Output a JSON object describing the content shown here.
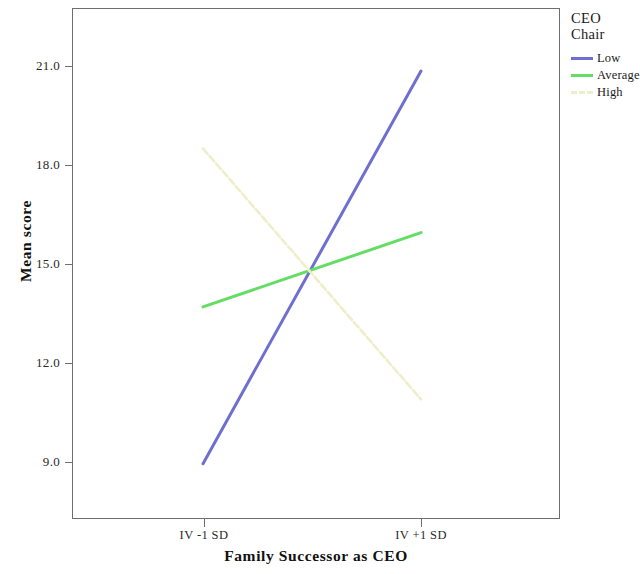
{
  "chart_data": {
    "type": "line",
    "title": "",
    "xlabel": "Family Successor as CEO",
    "ylabel": "Mean score",
    "categories": [
      "IV -1 SD",
      "IV +1 SD"
    ],
    "x": [
      0,
      1
    ],
    "ytick_labels": [
      "9.0",
      "12.0",
      "15.0",
      "18.0",
      "21.0"
    ],
    "ytick_values": [
      9.0,
      12.0,
      15.0,
      18.0,
      21.0
    ],
    "ylim": [
      7.6,
      22.5
    ],
    "xlim": [
      -0.5,
      1.5
    ],
    "grid": false,
    "legend_position": "right",
    "legend_title_line1": "CEO",
    "legend_title_line2": "Chair",
    "series": [
      {
        "name": "Low",
        "values": [
          8.95,
          20.85
        ],
        "color": "#6f6fd0",
        "style": "solid"
      },
      {
        "name": "Average",
        "values": [
          13.7,
          15.95
        ],
        "color": "#63dd63",
        "style": "solid"
      },
      {
        "name": "High",
        "values": [
          18.5,
          10.9
        ],
        "color": "#eeeeca",
        "style": "dashed"
      }
    ]
  },
  "axes": {
    "frame_color": "#6e6e6e",
    "background": "#ffffff"
  }
}
